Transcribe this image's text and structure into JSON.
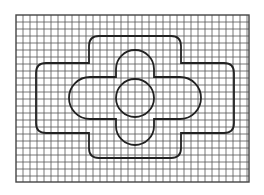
{
  "figure": {
    "grid": {
      "x0": 16,
      "y0": 15,
      "x1": 249,
      "y1": 182,
      "spacing": 7,
      "line_color": "#555555",
      "border_color": "#444444"
    },
    "stroke_color": "#222222",
    "shapes": {
      "outer_cross": {
        "top": 36,
        "bottom": 158,
        "left": 36,
        "right": 234,
        "step_left": 89,
        "step_right": 181,
        "step_top": 63,
        "step_bottom": 133,
        "corner_radius": 10
      },
      "inner_cross": {
        "vert_left": 116,
        "vert_right": 154,
        "vert_top": 50,
        "vert_bottom": 145,
        "horiz_left": 69,
        "horiz_right": 201,
        "horiz_top": 77,
        "horiz_bottom": 119
      },
      "circle": {
        "cx": 135,
        "cy": 98,
        "r": 19
      }
    }
  }
}
